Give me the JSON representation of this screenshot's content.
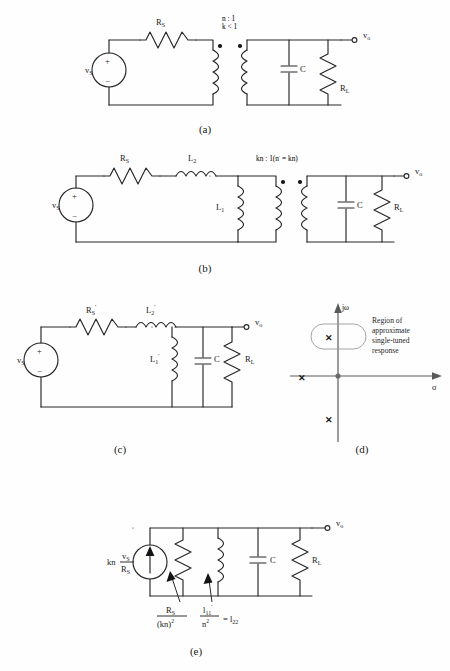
{
  "document": {
    "running_head": "",
    "background_color": "#fefefe",
    "ink_color": "#1a1a1a"
  },
  "figures": [
    {
      "id": "a",
      "caption": "(a)",
      "description": "Transformer-coupled tuned amplifier with ideal coupling ratio",
      "labels": {
        "source": "v",
        "source_sub": "S",
        "source_plus": "+",
        "source_minus": "−",
        "resistor_series": "R",
        "resistor_series_sub": "S",
        "turns_ratio": "n : 1",
        "coupling": "k < 1",
        "capacitor": "C",
        "load": "R",
        "load_sub": "L",
        "output": "v",
        "output_sub": "o"
      }
    },
    {
      "id": "b",
      "caption": "(b)",
      "description": "Equivalent circuit with leakage inductance L2 and magnetizing inductance L1",
      "labels": {
        "source": "v",
        "source_sub": "S",
        "source_plus": "+",
        "source_minus": "−",
        "resistor_series": "R",
        "resistor_series_sub": "S",
        "inductor_series": "L",
        "inductor_series_sub": "2",
        "inductor_shunt": "L",
        "inductor_shunt_sub": "1",
        "turns_ratio": "kn : 1(n′ = kn)",
        "capacitor": "C",
        "load": "R",
        "load_sub": "L",
        "output": "v",
        "output_sub": "o"
      }
    },
    {
      "id": "c",
      "caption": "(c)",
      "description": "Circuit referred to the secondary with primed element values",
      "labels": {
        "source": "v",
        "source_sub": "S",
        "source_plus": "+",
        "source_minus": "−",
        "resistor_series": "R",
        "resistor_series_sub": "S",
        "resistor_series_prime": "′",
        "inductor_series": "L",
        "inductor_series_sub": "2",
        "inductor_series_prime": "′",
        "inductor_shunt": "L",
        "inductor_shunt_sub": "1",
        "inductor_shunt_prime": "′",
        "capacitor": "C",
        "load": "R",
        "load_sub": "L",
        "output": "v",
        "output_sub": "o"
      }
    },
    {
      "id": "d",
      "caption": "(d)",
      "description": "Pole location plot in the complex s-plane",
      "labels": {
        "axis_imag": "jω",
        "axis_real": "σ",
        "region_line1": "Region of",
        "region_line2": "approximate",
        "region_line3": "single-tuned",
        "region_line4": "response",
        "pole_marker": "✕"
      },
      "poles": [
        {
          "name": "pole-upper-complex",
          "sigma": -0.18,
          "jomega": 0.62,
          "inside_region": true
        },
        {
          "name": "pole-real-axis",
          "sigma": -0.92,
          "jomega": 0.0,
          "inside_region": false
        },
        {
          "name": "pole-lower-complex",
          "sigma": -0.18,
          "jomega": -0.7,
          "inside_region": false
        }
      ]
    },
    {
      "id": "e",
      "caption": "(e)",
      "description": "Norton equivalent single-tuned circuit with reflected element values",
      "labels": {
        "current_source_prefix": "kn",
        "current_source_num": "v",
        "current_source_num_sub": "S",
        "current_source_den": "R",
        "current_source_den_sub": "S",
        "resistor_ann_num": "R",
        "resistor_ann_num_sub": "S",
        "resistor_ann_den": "(kn)",
        "resistor_ann_den_sup": "2",
        "inductor_ann_num": "l",
        "inductor_ann_num_sub": "11",
        "inductor_ann_num_prime": "′",
        "inductor_ann_den": "n",
        "inductor_ann_den_sup": "2",
        "inductor_ann_equals": "= l",
        "inductor_ann_equals_sub": "22",
        "capacitor": "C",
        "load": "R",
        "load_sub": "L",
        "output": "v",
        "output_sub": "o"
      }
    }
  ]
}
